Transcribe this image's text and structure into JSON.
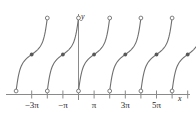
{
  "figure": {
    "title": "",
    "axis_labels": {
      "x": "x",
      "y": "y"
    },
    "x_tick_labels": [
      "−3π",
      "−π",
      "π",
      "3π",
      "5π"
    ]
  },
  "chart_data": {
    "type": "line",
    "title": "",
    "xlabel": "x",
    "ylabel": "y",
    "grid": false,
    "legend": null,
    "xlim": [
      -4.5,
      7.5
    ],
    "ylim": [
      -1.6,
      1.6
    ],
    "x_ticks": [
      -3,
      -2,
      -1,
      0,
      1,
      2,
      3,
      4,
      5,
      6,
      7
    ],
    "x_tick_labels_shown": {
      "-3": "−3π",
      "-1": "−π",
      "1": "π",
      "3": "3π",
      "5": "5π"
    },
    "x_tick_unit": "pi",
    "y_ticks": [],
    "period_in_pi": 2,
    "branches": [
      {
        "index": 0,
        "x_start_pi": -4.0,
        "x_end_pi": -2.0,
        "y_start": -1.0,
        "y_end": 1.0,
        "endpoints_open": true
      },
      {
        "index": 1,
        "x_start_pi": -2.0,
        "x_end_pi": 0.0,
        "y_start": -1.0,
        "y_end": 1.0,
        "endpoints_open": true
      },
      {
        "index": 2,
        "x_start_pi": 0.0,
        "x_end_pi": 2.0,
        "y_start": -1.0,
        "y_end": 1.0,
        "endpoints_open": true
      },
      {
        "index": 3,
        "x_start_pi": 2.0,
        "x_end_pi": 4.0,
        "y_start": -1.0,
        "y_end": 1.0,
        "endpoints_open": true
      },
      {
        "index": 4,
        "x_start_pi": 4.0,
        "x_end_pi": 6.0,
        "y_start": -1.0,
        "y_end": 1.0,
        "endpoints_open": true
      },
      {
        "index": 5,
        "x_start_pi": 6.0,
        "x_end_pi": 8.0,
        "y_start": -1.0,
        "y_end": 1.0,
        "endpoints_open": true
      }
    ],
    "open_points": [
      {
        "x_pi": -4.0,
        "y": -1.0
      },
      {
        "x_pi": -2.0,
        "y": 1.0
      },
      {
        "x_pi": -2.0,
        "y": -1.0
      },
      {
        "x_pi": 0.0,
        "y": 1.0
      },
      {
        "x_pi": 0.0,
        "y": -1.0
      },
      {
        "x_pi": 2.0,
        "y": 1.0
      },
      {
        "x_pi": 2.0,
        "y": -1.0
      },
      {
        "x_pi": 4.0,
        "y": 1.0
      },
      {
        "x_pi": 4.0,
        "y": -1.0
      },
      {
        "x_pi": 6.0,
        "y": 1.0
      },
      {
        "x_pi": 6.0,
        "y": -1.0
      },
      {
        "x_pi": 8.0,
        "y": 1.0
      }
    ],
    "filled_points": [
      {
        "x_pi": -3.0,
        "y": 0.0
      },
      {
        "x_pi": -1.0,
        "y": 0.0
      },
      {
        "x_pi": 1.0,
        "y": 0.0
      },
      {
        "x_pi": 3.0,
        "y": 0.0
      },
      {
        "x_pi": 5.0,
        "y": 0.0
      },
      {
        "x_pi": 7.0,
        "y": 0.0
      }
    ],
    "colors": {
      "curve": "#6f6f6f",
      "axis": "#8a8a8a",
      "text": "#262626",
      "background": "#ffffff"
    }
  }
}
